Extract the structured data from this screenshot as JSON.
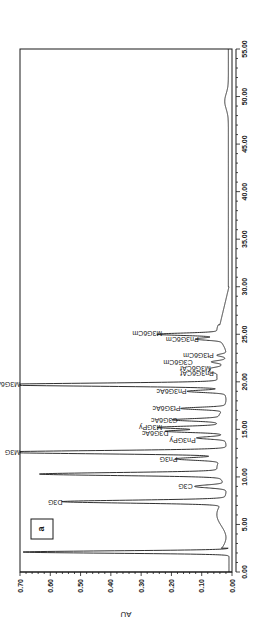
{
  "chart_data": {
    "type": "line",
    "orientation": "rotated-90-clockwise",
    "title": "",
    "panel_label": "a",
    "xlabel": "",
    "ylabel": "AU",
    "xlim": [
      0,
      55
    ],
    "ylim": [
      0,
      0.7
    ],
    "x_ticks": [
      "0.00",
      "5.00",
      "10.00",
      "15.00",
      "20.00",
      "25.00",
      "30.00",
      "35.00",
      "40.00",
      "45.00",
      "50.00",
      "55.00"
    ],
    "y_ticks": [
      "0.00",
      "0.10",
      "0.20",
      "0.30",
      "0.40",
      "0.50",
      "0.60",
      "0.70"
    ],
    "grid": false,
    "baseline": 0.01,
    "peaks": [
      {
        "label": "",
        "time": 2.1,
        "au": 0.68,
        "width": 0.12
      },
      {
        "label": "D3G",
        "time": 7.4,
        "au": 0.53,
        "width": 0.15
      },
      {
        "label": "C3G",
        "time": 9.0,
        "au": 0.1,
        "width": 0.15
      },
      {
        "label": "",
        "time": 10.3,
        "au": 0.59,
        "width": 0.15
      },
      {
        "label": "Pn3G",
        "time": 11.9,
        "au": 0.15,
        "width": 0.14
      },
      {
        "label": "M3G",
        "time": 12.6,
        "au": 0.75,
        "width": 0.16
      },
      {
        "label": "Pn3GPy",
        "time": 14.1,
        "au": 0.09,
        "width": 0.12
      },
      {
        "label": "D3G6Ac",
        "time": 14.8,
        "au": 0.18,
        "width": 0.12
      },
      {
        "label": "M3GPy",
        "time": 15.2,
        "au": 0.2,
        "width": 0.12
      },
      {
        "label": "C3G6Ac",
        "time": 16.0,
        "au": 0.15,
        "width": 0.12
      },
      {
        "label": "Pt3G6Ac",
        "time": 17.2,
        "au": 0.14,
        "width": 0.12
      },
      {
        "label": "Pn3G6Ac",
        "time": 19.0,
        "au": 0.12,
        "width": 0.12
      },
      {
        "label": "M3G6Ac",
        "time": 19.7,
        "au": 0.75,
        "width": 0.15
      },
      {
        "label": "Pn3G6CAf",
        "time": 21.1,
        "au": 0.03,
        "width": 0.12
      },
      {
        "label": "M3G6CAf",
        "time": 21.4,
        "au": 0.03,
        "width": 0.12
      },
      {
        "label": "C3G6Cm",
        "time": 22.1,
        "au": 0.04,
        "width": 0.12
      },
      {
        "label": "Pt3G6Cm",
        "time": 22.8,
        "au": 0.03,
        "width": 0.12
      },
      {
        "label": "Pn3G6Cm",
        "time": 24.5,
        "au": 0.08,
        "width": 0.12
      },
      {
        "label": "M3G6Cm",
        "time": 25.0,
        "au": 0.2,
        "width": 0.12
      },
      {
        "label": "",
        "time": 49.5,
        "au": 0.012,
        "width": 0.8
      }
    ],
    "labels": [
      {
        "text": "D3G",
        "time": 7.4,
        "au": 0.56
      },
      {
        "text": "C3G",
        "time": 9.0,
        "au": 0.13
      },
      {
        "text": "Pn3G",
        "time": 11.9,
        "au": 0.18
      },
      {
        "text": "M3G",
        "time": 12.6,
        "au": 0.7
      },
      {
        "text": "Pn3GPy",
        "time": 13.9,
        "au": 0.12
      },
      {
        "text": "D3G6Ac",
        "time": 14.6,
        "au": 0.21
      },
      {
        "text": "M3GPy",
        "time": 15.3,
        "au": 0.23
      },
      {
        "text": "C3G6Ac",
        "time": 16.0,
        "au": 0.18
      },
      {
        "text": "Pt3G6Ac",
        "time": 17.2,
        "au": 0.17
      },
      {
        "text": "Pn3G6Ac",
        "time": 19.0,
        "au": 0.15
      },
      {
        "text": "M3G6Ac",
        "time": 19.8,
        "au": 0.7
      },
      {
        "text": "Pn3G6CAf",
        "time": 20.9,
        "au": 0.06
      },
      {
        "text": "M3G6CAf",
        "time": 21.5,
        "au": 0.07
      },
      {
        "text": "C3G6Cm",
        "time": 22.1,
        "au": 0.13
      },
      {
        "text": "Pt3G6Cm",
        "time": 22.8,
        "au": 0.06
      },
      {
        "text": "Pn3G6Cm",
        "time": 24.5,
        "au": 0.11
      },
      {
        "text": "M3G6Cm",
        "time": 25.1,
        "au": 0.23
      }
    ]
  },
  "colors": {
    "line": "#1a1a1a",
    "background": "#ffffff"
  }
}
